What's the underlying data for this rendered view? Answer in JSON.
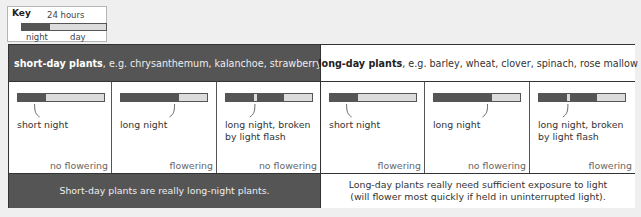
{
  "key": {
    "title": "Key",
    "duration": "24 hours",
    "night_label": "night",
    "day_label": "day",
    "night_fraction": 0.33
  },
  "colors": {
    "night": "#555555",
    "day": "#dcdcdc",
    "short_day_bg": "#555555",
    "long_day_bg": "#ffffff"
  },
  "groups": [
    {
      "header_bold": "short-day plants",
      "header_rest": ", e.g. chrysanthemum, kalanchoe, strawberry, sugar cane",
      "footer_line1": "Short-day plants are really long-night plants.",
      "footer_line2": "",
      "cells": [
        {
          "label_line1": "short night",
          "label_line2": "",
          "outcome": "no flowering",
          "night1": 0.32,
          "flash": 0,
          "night2": 0
        },
        {
          "label_line1": "long night",
          "label_line2": "",
          "outcome": "flowering",
          "night1": 0.68,
          "flash": 0,
          "night2": 0
        },
        {
          "label_line1": "long night, broken",
          "label_line2": "by light flash",
          "outcome": "no flowering",
          "night1": 0.32,
          "flash": 0.04,
          "night2": 0.32
        }
      ]
    },
    {
      "header_bold": "long-day plants",
      "header_rest": ", e.g. barley, wheat, clover, spinach, rose mallow",
      "footer_line1": "Long-day plants really need sufficient exposure to light",
      "footer_line2": "(will flower most quickly if held in uninterrupted light).",
      "cells": [
        {
          "label_line1": "short night",
          "label_line2": "",
          "outcome": "flowering",
          "night1": 0.32,
          "flash": 0,
          "night2": 0
        },
        {
          "label_line1": "long night",
          "label_line2": "",
          "outcome": "no flowering",
          "night1": 0.68,
          "flash": 0,
          "night2": 0
        },
        {
          "label_line1": "long night, broken",
          "label_line2": "by light flash",
          "outcome": "flowering",
          "night1": 0.32,
          "flash": 0.04,
          "night2": 0.32
        }
      ]
    }
  ]
}
